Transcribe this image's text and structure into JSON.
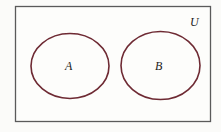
{
  "diagram": {
    "type": "venn",
    "title": "",
    "universe": {
      "label": "U",
      "border_color": "#555555"
    },
    "sets": [
      {
        "label": "A",
        "stroke_color": "#6e2a33",
        "cx": 70,
        "cy": 66,
        "rx": 39,
        "ry": 33
      },
      {
        "label": "B",
        "stroke_color": "#6e2a33",
        "cx": 160,
        "cy": 66,
        "rx": 39,
        "ry": 34
      }
    ],
    "relationship": "disjoint"
  }
}
